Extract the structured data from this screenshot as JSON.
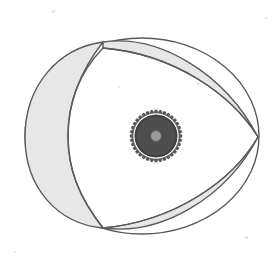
{
  "figure": {
    "name": "rotary-engine-rotor-diagram",
    "background_color": "#ffffff",
    "canvas": {
      "width": 276,
      "height": 272
    },
    "stroke_color": "#5a5a5a",
    "stroke_width": 1.4,
    "region_fill": "#e7e7e7",
    "interior_fill": "#ffffff",
    "housing": {
      "label": "housing-outline",
      "center_x": 142,
      "center_y": 136,
      "radius_x": 117,
      "radius_y": 98
    },
    "vertices": [
      {
        "label": "apex-top",
        "x": 103,
        "y": 42
      },
      {
        "label": "apex-right",
        "x": 258,
        "y": 137
      },
      {
        "label": "apex-bottom",
        "x": 103,
        "y": 228
      }
    ],
    "lunes": [
      {
        "label": "lune-left",
        "description": "thick crescent between housing arc and rotor flank",
        "fill": "#e7e7e7",
        "path": "M 103 42 C 58 48 25 86 25 137 C 25 188 58 224 103 228 C 78 196 68 168 68 136 C 68 103 79 73 103 42 Z"
      },
      {
        "label": "lune-top-right",
        "description": "thin sliver between upper housing arc and rotor flank",
        "fill": "#e7e7e7",
        "path": "M 103 42 C 160 34 225 74 258 137 C 232 95 175 54 103 48 Z"
      },
      {
        "label": "lune-bottom-right",
        "description": "thin sliver between lower housing arc and rotor flank",
        "fill": "#e7e7e7",
        "path": "M 258 137 C 226 198 161 236 103 228 C 176 221 233 180 258 137 Z"
      }
    ],
    "rotor": {
      "label": "rotor-interior",
      "fill": "#ffffff",
      "path": "M 103 48 C 175 54 232 95 258 137 C 233 180 176 221 103 228 C 78 196 68 168 68 136 C 68 103 79 73 103 48 Z"
    },
    "gear": {
      "label": "eccentric-shaft-gear",
      "center_x": 156,
      "center_y": 136,
      "outer_radius": 26,
      "root_radius": 23,
      "body_radius": 21.5,
      "hub_radius": 5.2,
      "tooth_count": 36,
      "body_color": "#4e4e4e",
      "tooth_color": "#555555",
      "rim_color": "#3f3f3f",
      "hub_color": "#9a9a9a",
      "hub_stroke": "#6d6d6d"
    },
    "speckles": [
      {
        "x": 52,
        "y": 10,
        "size": 3
      },
      {
        "x": 197,
        "y": 82,
        "size": 3
      },
      {
        "x": 118,
        "y": 86,
        "size": 2
      },
      {
        "x": 47,
        "y": 196,
        "size": 2
      },
      {
        "x": 245,
        "y": 236,
        "size": 3
      },
      {
        "x": 265,
        "y": 17,
        "size": 2
      },
      {
        "x": 14,
        "y": 251,
        "size": 2
      }
    ]
  }
}
